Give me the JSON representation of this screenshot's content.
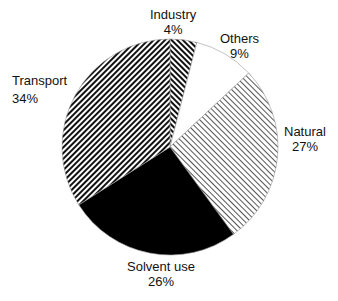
{
  "chart_data": {
    "type": "pie",
    "title": "",
    "start_angle_deg": 0,
    "direction": "clockwise",
    "slices": [
      {
        "label": "Industry",
        "value": 4,
        "pct_label": "4%",
        "fill": "hatch-backslash-dense"
      },
      {
        "label": "Others",
        "value": 9,
        "pct_label": "9%",
        "fill": "white"
      },
      {
        "label": "Natural",
        "value": 27,
        "pct_label": "27%",
        "fill": "hatch-slash-fine"
      },
      {
        "label": "Solvent use",
        "value": 26,
        "pct_label": "26%",
        "fill": "black"
      },
      {
        "label": "Transport",
        "value": 34,
        "pct_label": "34%",
        "fill": "hatch-slash-dense"
      }
    ]
  },
  "labels": {
    "industry": {
      "name": "Industry",
      "pct": "4%"
    },
    "others": {
      "name": "Others",
      "pct": "9%"
    },
    "natural": {
      "name": "Natural",
      "pct": "27%"
    },
    "solvent": {
      "name": "Solvent use",
      "pct": "26%"
    },
    "transport": {
      "name": "Transport",
      "pct": "34%"
    }
  }
}
